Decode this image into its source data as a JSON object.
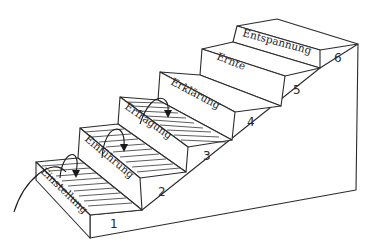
{
  "diagram": {
    "type": "staircase",
    "style": "hand-drawn line sketch",
    "stroke_color": "#2b2b2b",
    "background": "#ffffff",
    "steps": [
      {
        "number": "1",
        "label": "Einstellung",
        "hatched": true,
        "arrow_onto_next": true
      },
      {
        "number": "2",
        "label": "Einführung",
        "hatched": true,
        "arrow_onto_next": true
      },
      {
        "number": "3",
        "label": "Erfragung",
        "hatched": true,
        "arrow_onto_next": true
      },
      {
        "number": "4",
        "label": "Erklärung",
        "hatched": false,
        "arrow_onto_next": false
      },
      {
        "number": "5",
        "label": "Ernte",
        "hatched": false,
        "arrow_onto_next": false
      },
      {
        "number": "6",
        "label": "Entspannung",
        "hatched": false,
        "arrow_onto_next": false
      }
    ],
    "entry_curve": "curved line rising from lower-left onto step 1"
  }
}
